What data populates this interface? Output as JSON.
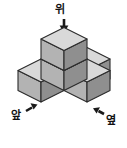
{
  "figure": {
    "labels": {
      "top": "위",
      "front": "앞",
      "side": "옆"
    },
    "arrows": {
      "top": "arrow-down-icon",
      "front": "arrow-right-icon",
      "side": "arrow-left-icon"
    },
    "cube_count": 5,
    "colors": {
      "face_top": "#d9d9d9",
      "face_left": "#b3b3b3",
      "face_right": "#8f8f8f",
      "outline": "#2b2b2b",
      "arrow": "#1a1a1a",
      "background": "#ffffff"
    },
    "cubes": [
      {
        "name": "column-upper",
        "cx": 64,
        "cy": 46
      },
      {
        "name": "column-lower",
        "cx": 64,
        "cy": 66
      },
      {
        "name": "arm-left-front",
        "cx": 41,
        "cy": 79
      },
      {
        "name": "arm-right-near",
        "cx": 87,
        "cy": 79
      },
      {
        "name": "arm-right-far",
        "cx": 87,
        "cy": 79
      }
    ]
  }
}
